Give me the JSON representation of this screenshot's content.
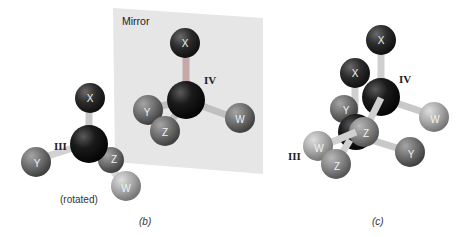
{
  "mirror": {
    "label": "Mirror",
    "color": "#e6e6e6"
  },
  "colors": {
    "center_atom": "#151515",
    "x_atom": "#2a2a2a",
    "y_atom": "#6e6e6e",
    "z_atom": "#8a8a8a",
    "w_atom": "#a8a8a8",
    "bond": "#c9c9c9"
  },
  "panel_b": {
    "caption": "(b)",
    "molecule_iii": {
      "roman": "III",
      "note": "(rotated)",
      "atoms": {
        "x": "X",
        "y": "Y",
        "z": "Z",
        "w": "W"
      }
    },
    "molecule_iv": {
      "roman": "IV",
      "atoms": {
        "x": "X",
        "y": "Y",
        "z": "Z",
        "w": "W"
      }
    }
  },
  "panel_c": {
    "caption": "(c)",
    "molecule_iv": {
      "roman": "IV",
      "atoms": {
        "x": "X",
        "w": "W",
        "z": "Z"
      }
    },
    "molecule_iii": {
      "roman": "III",
      "atoms": {
        "x": "X",
        "y": "Y",
        "w": "W",
        "z": "Z",
        "y2": "Y"
      }
    }
  }
}
